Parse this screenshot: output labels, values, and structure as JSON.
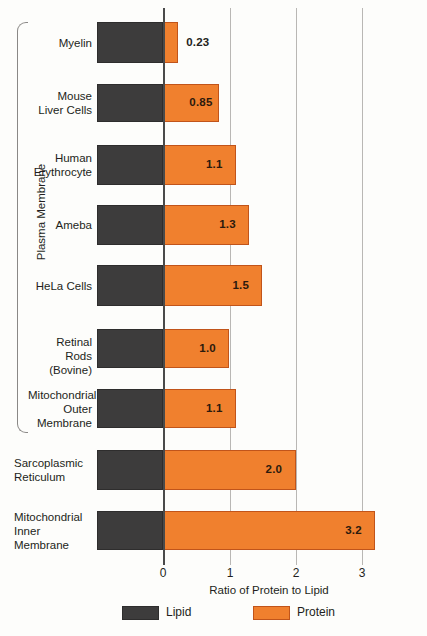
{
  "chart_data": {
    "type": "bar",
    "orientation": "horizontal",
    "title": "",
    "xlabel": "Ratio of Protein to Lipid",
    "ylabel": "",
    "xlim": [
      -1,
      3.4
    ],
    "xticks": [
      "0",
      "1",
      "2",
      "3"
    ],
    "grid": true,
    "legend_position": "bottom",
    "group_bracket_label": "Plasma Membrane",
    "series": [
      {
        "name": "Lipid",
        "color": "#3d3c3c"
      },
      {
        "name": "Protein",
        "color": "#f0802e"
      }
    ],
    "categories": [
      "Myelin",
      "Mouse\nLiver Cells",
      "Human\nErythrocyte",
      "Ameba",
      "HeLa Cells",
      "Retinal Rods\n(Bovine)",
      "Mitochondrial\nOuter\nMembrane",
      "Sarcoplasmic\nReticulum",
      "Mitochondrial\nInner\nMembrane"
    ],
    "values": [
      0.23,
      0.85,
      1.1,
      1.3,
      1.5,
      1.0,
      1.1,
      2.0,
      3.2
    ],
    "value_labels": [
      "0.23",
      "0.85",
      "1.1",
      "1.3",
      "1.5",
      "1.0",
      "1.1",
      "2.0",
      "3.2"
    ],
    "in_bracket": [
      true,
      true,
      true,
      true,
      true,
      true,
      true,
      false,
      false
    ],
    "label_align": [
      "right",
      "right",
      "right",
      "right",
      "right",
      "right",
      "right",
      "left",
      "left"
    ]
  },
  "legend": {
    "items": [
      {
        "label": "Lipid",
        "swatch": "lipid"
      },
      {
        "label": "Protein",
        "swatch": "protein"
      }
    ]
  },
  "axis": {
    "title": "Ratio of Protein to Lipid",
    "ticks": [
      "0",
      "1",
      "2",
      "3"
    ]
  },
  "bracket": {
    "label": "Plasma Membrane"
  }
}
